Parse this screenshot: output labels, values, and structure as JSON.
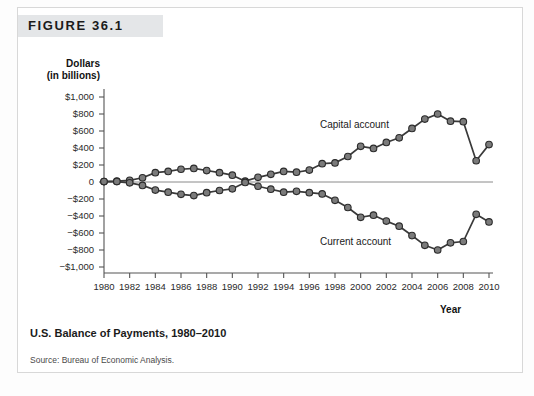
{
  "figure": {
    "label": "FIGURE 36.1",
    "caption": "U.S. Balance of Payments, 1980–2010",
    "source": "Source: Bureau of Economic Analysis."
  },
  "colors": {
    "marker_fill": "#7b7b7b",
    "marker_stroke": "#2b2b2b",
    "line": "#3a3a3a",
    "axis": "#555555",
    "zero_line": "#8a8a8a",
    "band": "#e4e6e8",
    "border": "#d8d8d8"
  },
  "chart_data": {
    "type": "line",
    "title": "U.S. Balance of Payments, 1980–2010",
    "xlabel": "Year",
    "ylabel": "Dollars (in billions)",
    "ylabel_line1": "Dollars",
    "ylabel_line2": "(in billions)",
    "xlim": [
      1980,
      2010
    ],
    "ylim": [
      -1000,
      1000
    ],
    "grid": false,
    "legend": "inline-annotations",
    "ytick_labels": [
      "$1,000",
      "$800",
      "$600",
      "$400",
      "$200",
      "0",
      "−$200",
      "−$400",
      "−$600",
      "−$800",
      "−$1,000"
    ],
    "ytick_values": [
      1000,
      800,
      600,
      400,
      200,
      0,
      -200,
      -400,
      -600,
      -800,
      -1000
    ],
    "xtick_labels": [
      "1980",
      "1982",
      "1984",
      "1986",
      "1988",
      "1990",
      "1992",
      "1994",
      "1996",
      "1998",
      "2000",
      "2002",
      "2004",
      "2006",
      "2008",
      "2010"
    ],
    "xtick_values": [
      1980,
      1982,
      1984,
      1986,
      1988,
      1990,
      1992,
      1994,
      1996,
      1998,
      2000,
      2002,
      2004,
      2006,
      2008,
      2010
    ],
    "x": [
      1980,
      1981,
      1982,
      1983,
      1984,
      1985,
      1986,
      1987,
      1988,
      1989,
      1990,
      1991,
      1992,
      1993,
      1994,
      1995,
      1996,
      1997,
      1998,
      1999,
      2000,
      2001,
      2002,
      2003,
      2004,
      2005,
      2006,
      2007,
      2008,
      2009,
      2010
    ],
    "series": [
      {
        "name": "Capital account",
        "label": "Capital account",
        "values": [
          5,
          10,
          20,
          50,
          110,
          125,
          150,
          160,
          135,
          110,
          80,
          10,
          55,
          90,
          125,
          115,
          140,
          215,
          225,
          300,
          420,
          395,
          465,
          520,
          630,
          740,
          800,
          715,
          710,
          250,
          440
        ]
      },
      {
        "name": "Current account",
        "label": "Current account",
        "values": [
          5,
          5,
          -10,
          -40,
          -95,
          -120,
          -145,
          -160,
          -125,
          -100,
          -80,
          -5,
          -50,
          -85,
          -120,
          -110,
          -125,
          -140,
          -215,
          -300,
          -415,
          -390,
          -460,
          -520,
          -630,
          -745,
          -800,
          -715,
          -700,
          -380,
          -470
        ]
      }
    ]
  }
}
